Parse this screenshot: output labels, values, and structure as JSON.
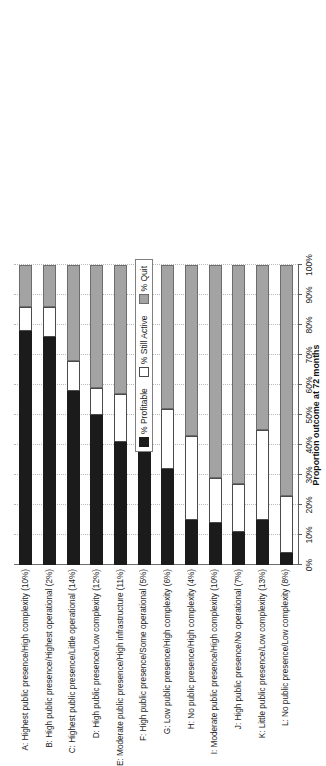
{
  "chart_data": {
    "type": "bar",
    "orientation": "horizontal-stacked",
    "title": "",
    "xlabel": "Proportion outcome at 72 months",
    "ylabel": "",
    "xlim": [
      0,
      100
    ],
    "grid": true,
    "legend_position": "top-right",
    "tick_labels": [
      "0%",
      "10%",
      "20%",
      "30%",
      "40%",
      "50%",
      "60%",
      "70%",
      "80%",
      "90%",
      "100%"
    ],
    "tick_values": [
      0,
      10,
      20,
      30,
      40,
      50,
      60,
      70,
      80,
      90,
      100
    ],
    "categories": [
      "A: Highest public presence/High complexity (10%)",
      "B: High public presence/Highest operational (2%)",
      "C: Highest public presence/Little operational (14%)",
      "D: High public presence/Low complexity (12%)",
      "E: Moderate public presence/High infrastructure (11%)",
      "F: High public presence/Some operational (5%)",
      "G: Low public presence/High complexity (6%)",
      "H: No public presence/High complexity (4%)",
      "I: Moderate public presence/High complexity (10%)",
      "J: High public presence/No operational (7%)",
      "K: Little public presence/Low complexity (13%)",
      "L: No public presence/Low complexity (8%)"
    ],
    "series": [
      {
        "name": "% Profitable",
        "color": "#1b1b1b",
        "values": [
          78,
          76,
          58,
          50,
          41,
          41,
          32,
          15,
          14,
          11,
          15,
          4
        ]
      },
      {
        "name": "% Still Active",
        "color": "#ffffff",
        "values": [
          8,
          10,
          10,
          9,
          16,
          11,
          20,
          28,
          15,
          16,
          30,
          19
        ]
      },
      {
        "name": "% Quit",
        "color": "#a3a3a3",
        "values": [
          14,
          14,
          32,
          41,
          43,
          48,
          48,
          57,
          71,
          73,
          55,
          77
        ]
      }
    ]
  },
  "legend": {
    "items": [
      {
        "label": "% Profitable",
        "swatch": "black-square-icon"
      },
      {
        "label": "% Still Active",
        "swatch": "white-square-icon"
      },
      {
        "label": "% Quit",
        "swatch": "gray-square-icon"
      }
    ]
  }
}
